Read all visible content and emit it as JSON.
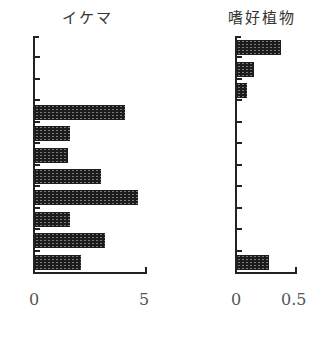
{
  "chart_data": [
    {
      "type": "bar",
      "orientation": "horizontal",
      "title": "イケマ",
      "categories": [
        "1",
        "2",
        "3",
        "4",
        "5",
        "6",
        "7",
        "8",
        "9",
        "10",
        "11"
      ],
      "values": [
        0,
        0,
        0,
        4.1,
        1.6,
        1.5,
        3.0,
        4.7,
        1.6,
        3.2,
        2.1
      ],
      "xlabel": "",
      "ylabel": "",
      "xlim": [
        0,
        5
      ],
      "xticks": [
        "0",
        "5"
      ]
    },
    {
      "type": "bar",
      "orientation": "horizontal",
      "title": "嗜好植物",
      "categories": [
        "1",
        "2",
        "3",
        "4",
        "5",
        "6",
        "7",
        "8",
        "9",
        "10",
        "11"
      ],
      "values": [
        0.38,
        0.15,
        0.09,
        0,
        0,
        0,
        0,
        0,
        0,
        0,
        0.28
      ],
      "xlabel": "",
      "ylabel": "",
      "xlim": [
        0,
        0.5
      ],
      "xticks": [
        "0",
        "0.5"
      ]
    }
  ],
  "left": {
    "title": "イケマ",
    "tick0": "0",
    "tick1": "5"
  },
  "right": {
    "title": "嗜好植物",
    "tick0": "0",
    "tick1": "0.5"
  }
}
